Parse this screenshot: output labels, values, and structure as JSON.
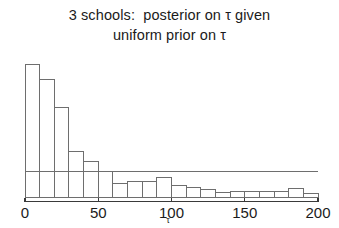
{
  "title": {
    "line1": "3 schools:  posterior on τ given",
    "line2": "uniform prior on τ"
  },
  "axis": {
    "x_label": "τ",
    "x_ticks": [
      "0",
      "50",
      "100",
      "150",
      "200"
    ]
  },
  "colors": {
    "ink": "#1b1b1b",
    "bar_stroke": "#6e6e6e",
    "axis": "#3a3a3a",
    "reference_line": "#6e6e6e",
    "background": "#ffffff"
  },
  "chart_data": {
    "type": "bar",
    "title": "3 schools:  posterior on τ given uniform prior on τ",
    "xlabel": "τ",
    "ylabel": "",
    "xlim": [
      0,
      200
    ],
    "ylim": [
      0,
      1.0
    ],
    "grid": false,
    "legend": null,
    "bin_width": 10,
    "bin_edges": [
      0,
      10,
      20,
      30,
      40,
      50,
      60,
      70,
      80,
      90,
      100,
      110,
      120,
      130,
      140,
      150,
      160,
      170,
      180,
      190,
      200
    ],
    "categories": [
      "0-10",
      "10-20",
      "20-30",
      "30-40",
      "40-50",
      "50-60",
      "60-70",
      "70-80",
      "80-90",
      "90-100",
      "100-110",
      "110-120",
      "120-130",
      "130-140",
      "140-150",
      "150-160",
      "160-170",
      "170-180",
      "180-190",
      "190-200"
    ],
    "values": [
      1.0,
      0.885,
      0.675,
      0.345,
      0.265,
      0.195,
      0.105,
      0.115,
      0.115,
      0.145,
      0.085,
      0.075,
      0.06,
      0.035,
      0.045,
      0.045,
      0.045,
      0.04,
      0.065,
      0.03
    ],
    "annotations": [
      {
        "type": "horizontal-line",
        "y": 0.195,
        "x_from": 0,
        "x_to": 200,
        "label": ""
      }
    ]
  }
}
